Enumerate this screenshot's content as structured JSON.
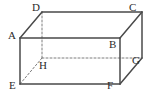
{
  "figure": {
    "name": "rectangular-cuboid",
    "width": 146,
    "height": 98,
    "background_color": "#ffffff",
    "edge_color": "#4a4a4a",
    "hidden_edge_color": "#7d7d7d",
    "label_color": "#2b2b2b",
    "solid_edge_width": 1.5,
    "hidden_edge_width": 1.0,
    "hidden_edge_dash": "2,2"
  },
  "vertices": [
    {
      "id": "A",
      "label": "A",
      "x": 20,
      "y": 38,
      "label_x": 8,
      "label_y": 30,
      "hidden": false
    },
    {
      "id": "B",
      "label": "B",
      "x": 120,
      "y": 38,
      "label_x": 109,
      "label_y": 39,
      "hidden": false
    },
    {
      "id": "C",
      "label": "C",
      "x": 142,
      "y": 12,
      "label_x": 129,
      "label_y": 2,
      "hidden": false
    },
    {
      "id": "D",
      "label": "D",
      "x": 42,
      "y": 12,
      "label_x": 32,
      "label_y": 2,
      "hidden": false
    },
    {
      "id": "E",
      "label": "E",
      "x": 20,
      "y": 84,
      "label_x": 9,
      "label_y": 80,
      "hidden": false
    },
    {
      "id": "F",
      "label": "F",
      "x": 120,
      "y": 84,
      "label_x": 107,
      "label_y": 80,
      "hidden": false
    },
    {
      "id": "G",
      "label": "G",
      "x": 142,
      "y": 58,
      "label_x": 132,
      "label_y": 55,
      "hidden": false
    },
    {
      "id": "H",
      "label": "H",
      "x": 42,
      "y": 58,
      "label_x": 39,
      "label_y": 60,
      "hidden": true
    }
  ],
  "edges": [
    {
      "id": "AB",
      "from": "A",
      "to": "B",
      "hidden": false
    },
    {
      "id": "BF",
      "from": "B",
      "to": "F",
      "hidden": false
    },
    {
      "id": "FE",
      "from": "F",
      "to": "E",
      "hidden": false
    },
    {
      "id": "EA",
      "from": "E",
      "to": "A",
      "hidden": false
    },
    {
      "id": "DC",
      "from": "D",
      "to": "C",
      "hidden": false
    },
    {
      "id": "CG",
      "from": "C",
      "to": "G",
      "hidden": false
    },
    {
      "id": "AD",
      "from": "A",
      "to": "D",
      "hidden": false
    },
    {
      "id": "BC",
      "from": "B",
      "to": "C",
      "hidden": false
    },
    {
      "id": "FG",
      "from": "F",
      "to": "G",
      "hidden": false
    },
    {
      "id": "DH",
      "from": "D",
      "to": "H",
      "hidden": true
    },
    {
      "id": "HG",
      "from": "H",
      "to": "G",
      "hidden": true
    },
    {
      "id": "EH",
      "from": "E",
      "to": "H",
      "hidden": true
    }
  ]
}
